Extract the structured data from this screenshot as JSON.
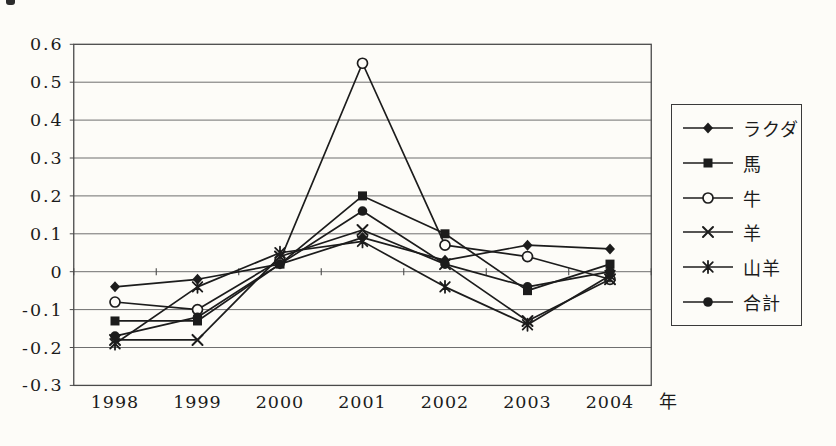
{
  "colors": {
    "line": "#1c1c1c",
    "grid": "#6f6f6f",
    "plot_border": "#4a4a4a",
    "background": "#fdfcf8",
    "text": "#1b1b1b"
  },
  "axis": {
    "yticks": [
      "0.6",
      "0.5",
      "0.4",
      "0.3",
      "0.2",
      "0.1",
      "0",
      "-0.1",
      "-0.2",
      "-0.3"
    ],
    "xticks": [
      "1998",
      "1999",
      "2000",
      "2001",
      "2002",
      "2003",
      "2004"
    ],
    "xlabel": "年"
  },
  "legend": {
    "items": [
      {
        "key": "camel",
        "label": "ラクダ",
        "marker": "diamond-filled"
      },
      {
        "key": "horse",
        "label": "馬",
        "marker": "square-filled"
      },
      {
        "key": "cattle",
        "label": "牛",
        "marker": "circle-open"
      },
      {
        "key": "sheep",
        "label": "羊",
        "marker": "x-cross"
      },
      {
        "key": "goat",
        "label": "山羊",
        "marker": "asterisk"
      },
      {
        "key": "total",
        "label": "合計",
        "marker": "circle-filled"
      }
    ]
  },
  "chart_data": {
    "type": "line",
    "x": [
      1998,
      1999,
      2000,
      2001,
      2002,
      2003,
      2004
    ],
    "xlabel": "年",
    "ylim": [
      -0.3,
      0.6
    ],
    "ytick_step": 0.1,
    "grid": "horizontal",
    "legend_position": "right",
    "series": [
      {
        "name": "ラクダ",
        "key": "camel",
        "marker": "diamond-filled",
        "values": [
          -0.04,
          -0.02,
          0.02,
          0.09,
          0.03,
          0.07,
          0.06
        ]
      },
      {
        "name": "馬",
        "key": "horse",
        "marker": "square-filled",
        "values": [
          -0.13,
          -0.13,
          0.02,
          0.2,
          0.1,
          -0.05,
          0.02
        ]
      },
      {
        "name": "牛",
        "key": "cattle",
        "marker": "circle-open",
        "values": [
          -0.08,
          -0.1,
          0.03,
          0.55,
          0.07,
          0.04,
          -0.02
        ]
      },
      {
        "name": "羊",
        "key": "sheep",
        "marker": "x-cross",
        "values": [
          -0.18,
          -0.18,
          0.04,
          0.11,
          0.02,
          -0.13,
          -0.02
        ]
      },
      {
        "name": "山羊",
        "key": "goat",
        "marker": "asterisk",
        "values": [
          -0.19,
          -0.04,
          0.05,
          0.08,
          -0.04,
          -0.14,
          -0.01
        ]
      },
      {
        "name": "合計",
        "key": "total",
        "marker": "circle-filled",
        "values": [
          -0.17,
          -0.12,
          0.02,
          0.16,
          0.02,
          -0.04,
          0.0
        ]
      }
    ]
  }
}
